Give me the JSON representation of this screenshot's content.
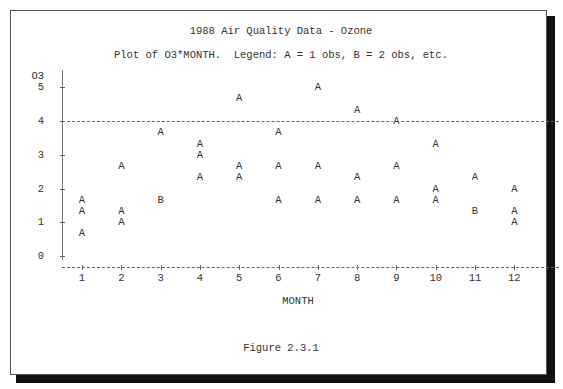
{
  "title": "1988 Air Quality Data - Ozone",
  "subtitle": "Plot of O3*MONTH.  Legend: A = 1 obs, B = 2 obs, etc.",
  "y_axis_label": "O3",
  "x_axis_label": "MONTH",
  "caption": "Figure 2.3.1",
  "y_ticks": [
    "5",
    "4",
    "3",
    "2",
    "1",
    "0"
  ],
  "x_ticks": [
    "1",
    "2",
    "3",
    "4",
    "5",
    "6",
    "7",
    "8",
    "9",
    "10",
    "11",
    "12"
  ],
  "colors": {
    "text": "#333333",
    "axis": "#666666",
    "frame": "#555555",
    "shadow": "#111111"
  },
  "chart_data": {
    "type": "scatter",
    "title": "1988 Air Quality Data - Ozone",
    "subtitle": "Plot of O3*MONTH.  Legend: A = 1 obs, B = 2 obs, etc.",
    "xlabel": "MONTH",
    "ylabel": "O3",
    "xlim": [
      1,
      12
    ],
    "ylim": [
      0,
      5
    ],
    "x_ticks": [
      1,
      2,
      3,
      4,
      5,
      6,
      7,
      8,
      9,
      10,
      11,
      12
    ],
    "y_ticks": [
      0,
      1,
      2,
      3,
      4,
      5
    ],
    "reference_line": {
      "y": 4,
      "style": "dashed"
    },
    "legend": {
      "A": "1 obs",
      "B": "2 obs"
    },
    "caption": "Figure 2.3.1",
    "points": [
      {
        "x": 1,
        "y": 1.67,
        "symbol": "A",
        "count": 1
      },
      {
        "x": 1,
        "y": 1.33,
        "symbol": "A",
        "count": 1
      },
      {
        "x": 1,
        "y": 0.67,
        "symbol": "A",
        "count": 1
      },
      {
        "x": 2,
        "y": 2.67,
        "symbol": "A",
        "count": 1
      },
      {
        "x": 2,
        "y": 1.33,
        "symbol": "A",
        "count": 1
      },
      {
        "x": 2,
        "y": 1.0,
        "symbol": "A",
        "count": 1
      },
      {
        "x": 3,
        "y": 3.67,
        "symbol": "A",
        "count": 1
      },
      {
        "x": 3,
        "y": 1.67,
        "symbol": "B",
        "count": 2
      },
      {
        "x": 4,
        "y": 3.33,
        "symbol": "A",
        "count": 1
      },
      {
        "x": 4,
        "y": 3.0,
        "symbol": "A",
        "count": 1
      },
      {
        "x": 4,
        "y": 2.33,
        "symbol": "A",
        "count": 1
      },
      {
        "x": 5,
        "y": 4.67,
        "symbol": "A",
        "count": 1
      },
      {
        "x": 5,
        "y": 2.67,
        "symbol": "A",
        "count": 1
      },
      {
        "x": 5,
        "y": 2.33,
        "symbol": "A",
        "count": 1
      },
      {
        "x": 6,
        "y": 3.67,
        "symbol": "A",
        "count": 1
      },
      {
        "x": 6,
        "y": 2.67,
        "symbol": "A",
        "count": 1
      },
      {
        "x": 6,
        "y": 1.67,
        "symbol": "A",
        "count": 1
      },
      {
        "x": 7,
        "y": 5.0,
        "symbol": "A",
        "count": 1
      },
      {
        "x": 7,
        "y": 2.67,
        "symbol": "A",
        "count": 1
      },
      {
        "x": 7,
        "y": 1.67,
        "symbol": "A",
        "count": 1
      },
      {
        "x": 8,
        "y": 4.33,
        "symbol": "A",
        "count": 1
      },
      {
        "x": 8,
        "y": 2.33,
        "symbol": "A",
        "count": 1
      },
      {
        "x": 8,
        "y": 1.67,
        "symbol": "A",
        "count": 1
      },
      {
        "x": 9,
        "y": 4.0,
        "symbol": "A",
        "count": 1
      },
      {
        "x": 9,
        "y": 2.67,
        "symbol": "A",
        "count": 1
      },
      {
        "x": 9,
        "y": 1.67,
        "symbol": "A",
        "count": 1
      },
      {
        "x": 10,
        "y": 3.33,
        "symbol": "A",
        "count": 1
      },
      {
        "x": 10,
        "y": 2.0,
        "symbol": "A",
        "count": 1
      },
      {
        "x": 10,
        "y": 1.67,
        "symbol": "A",
        "count": 1
      },
      {
        "x": 11,
        "y": 2.33,
        "symbol": "A",
        "count": 1
      },
      {
        "x": 11,
        "y": 1.33,
        "symbol": "B",
        "count": 2
      },
      {
        "x": 12,
        "y": 2.0,
        "symbol": "A",
        "count": 1
      },
      {
        "x": 12,
        "y": 1.33,
        "symbol": "A",
        "count": 1
      },
      {
        "x": 12,
        "y": 1.0,
        "symbol": "A",
        "count": 1
      }
    ]
  }
}
